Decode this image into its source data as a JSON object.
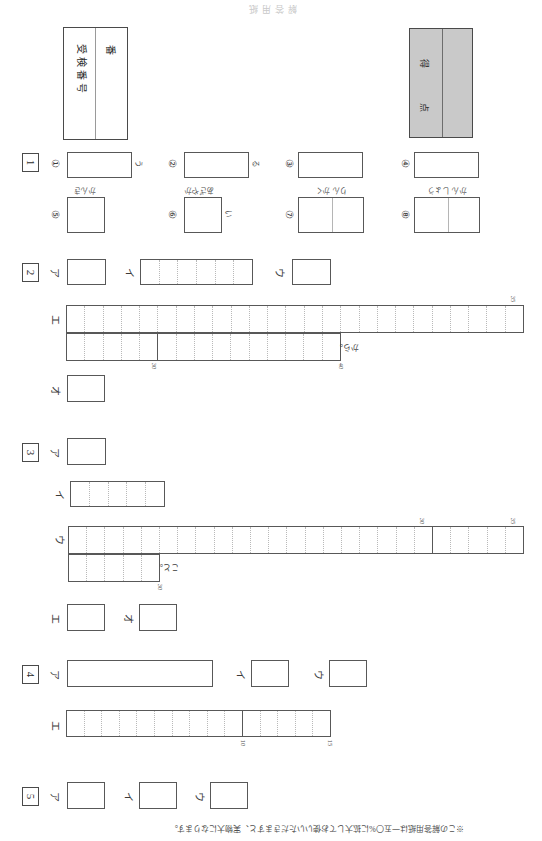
{
  "header": {
    "title": "解答用紙"
  },
  "exam_number": {
    "label": "受検番号",
    "suffix": "番"
  },
  "score": {
    "label_top": "得",
    "label_bottom": "点",
    "fill_color": "#c9c9c9"
  },
  "questions": [
    {
      "number": "1",
      "items": [
        {
          "mark": "①",
          "tail": "う",
          "hint": ""
        },
        {
          "mark": "②",
          "tail": "る",
          "hint": ""
        },
        {
          "mark": "③",
          "tail": "",
          "hint": ""
        },
        {
          "mark": "④",
          "tail": "",
          "hint": ""
        },
        {
          "mark": "⑤",
          "tail": "",
          "hint": "かんき"
        },
        {
          "mark": "⑥",
          "tail": "い",
          "hint": "あざやか"
        },
        {
          "mark": "⑦",
          "tail": "",
          "hint": "りん かく"
        },
        {
          "mark": "⑧",
          "tail": "",
          "hint": "かん しょう"
        }
      ]
    },
    {
      "number": "2",
      "labels": [
        "ア",
        "イ",
        "ウ",
        "エ",
        "オ"
      ],
      "grid_six_cells": 6,
      "long_grid": {
        "row1_cells": 25,
        "row2_cells": 15,
        "ticks": [
          {
            "value": "35",
            "where": "row1-end"
          },
          {
            "value": "30",
            "where": "row2-mid"
          },
          {
            "value": "40",
            "where": "row2-end"
          }
        ],
        "tail_text": "から。"
      }
    },
    {
      "number": "3",
      "labels": [
        "ア",
        "イ",
        "ウ",
        "エ",
        "オ"
      ],
      "grid_five_cells": 5,
      "long_grid": {
        "row1_cells": 25,
        "row2_cells": 5,
        "ticks": [
          {
            "value": "30",
            "where": "row1-major"
          },
          {
            "value": "35",
            "where": "row1-end"
          },
          {
            "value": "30",
            "where": "row2-end"
          }
        ],
        "tail_text": "こと。"
      }
    },
    {
      "number": "4",
      "labels": [
        "ア",
        "イ",
        "ウ",
        "エ"
      ],
      "long_grid": {
        "cells": 15,
        "ticks": [
          {
            "value": "10",
            "where": "major"
          },
          {
            "value": "15",
            "where": "end"
          }
        ]
      }
    },
    {
      "number": "5",
      "labels": [
        "ア",
        "イ",
        "ウ"
      ]
    }
  ],
  "bottom_note": "※この解答用紙は一五〇%に拡大してお使いいただきますと、実物大になります。"
}
